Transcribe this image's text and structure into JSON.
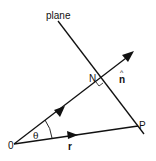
{
  "diagram": {
    "title": "",
    "labels": {
      "plane": "plane",
      "origin": "0",
      "foot": "N",
      "point": "P",
      "normal": "n",
      "normal_hat": "^",
      "position_vector": "r",
      "angle": "θ"
    },
    "elements": [
      {
        "id": "plane-line",
        "kind": "line",
        "meaning": "plane (edge view)"
      },
      {
        "id": "normal-vector",
        "kind": "arrow",
        "meaning": "unit normal n̂ through N"
      },
      {
        "id": "position-vector",
        "kind": "arrow",
        "meaning": "position vector r from 0 to P"
      },
      {
        "id": "angle-arc",
        "kind": "arc",
        "meaning": "angle θ between r and n̂"
      },
      {
        "id": "right-angle-mark",
        "kind": "mark",
        "meaning": "normal perpendicular to plane at N"
      }
    ],
    "colors": {
      "stroke": "#111111",
      "background": "#ffffff"
    }
  }
}
